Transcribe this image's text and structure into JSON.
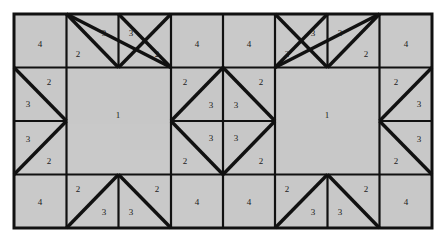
{
  "figure": {
    "name": "quilt-block-pattern",
    "background_color": "#ffffff",
    "patch_fill_color": "#c9c9c9",
    "line_color": "#111111",
    "grid": {
      "columns": 8,
      "rows": 4,
      "cell_width": 52.25,
      "cell_height": 53.5,
      "origin_x": 14,
      "origin_y": 14,
      "width": 418,
      "height": 214
    }
  },
  "chart_data": {
    "type": "diagram",
    "xlabel": "",
    "ylabel": "",
    "legend": [],
    "piece_codes": [
      "1",
      "2",
      "3",
      "4"
    ],
    "patches": [
      {
        "id": "r1c1",
        "label": "4",
        "shape": "square",
        "row": 1,
        "col": 1,
        "lx": 40,
        "ly": 45
      },
      {
        "id": "r1c2a",
        "label": "2",
        "shape": "tri-lower-left",
        "row": 1,
        "col": 2,
        "lx": 78,
        "ly": 55
      },
      {
        "id": "r1c2b",
        "label": "3",
        "shape": "tri-upper-right",
        "row": 1,
        "col": 2,
        "lx": 104,
        "ly": 34
      },
      {
        "id": "r1c3a",
        "label": "3",
        "shape": "tri-upper-left",
        "row": 1,
        "col": 3,
        "lx": 131,
        "ly": 34
      },
      {
        "id": "r1c3b",
        "label": "2",
        "shape": "tri-lower-right",
        "row": 1,
        "col": 3,
        "lx": 157,
        "ly": 55
      },
      {
        "id": "r1c4",
        "label": "4",
        "shape": "square",
        "row": 1,
        "col": 4,
        "lx": 197,
        "ly": 45
      },
      {
        "id": "r1c5",
        "label": "4",
        "shape": "square",
        "row": 1,
        "col": 5,
        "lx": 249,
        "ly": 45
      },
      {
        "id": "r1c6a",
        "label": "2",
        "shape": "tri-lower-left",
        "row": 1,
        "col": 6,
        "lx": 287,
        "ly": 55
      },
      {
        "id": "r1c6b",
        "label": "3",
        "shape": "tri-upper-right",
        "row": 1,
        "col": 6,
        "lx": 313,
        "ly": 34
      },
      {
        "id": "r1c7a",
        "label": "3",
        "shape": "tri-upper-left",
        "row": 1,
        "col": 7,
        "lx": 340,
        "ly": 34
      },
      {
        "id": "r1c7b",
        "label": "2",
        "shape": "tri-lower-right",
        "row": 1,
        "col": 7,
        "lx": 366,
        "ly": 55
      },
      {
        "id": "r1c8",
        "label": "4",
        "shape": "square",
        "row": 1,
        "col": 8,
        "lx": 406,
        "ly": 45
      },
      {
        "id": "r2c1a",
        "label": "2",
        "shape": "tri-upper-right",
        "row": 2,
        "col": 1,
        "lx": 49,
        "ly": 83
      },
      {
        "id": "r2c1b",
        "label": "3",
        "shape": "tri-lower-left",
        "row": 2,
        "col": 1,
        "lx": 28,
        "ly": 105
      },
      {
        "id": "big-left",
        "label": "1",
        "shape": "big-square",
        "row": 2,
        "col": 2,
        "lx": 118,
        "ly": 116
      },
      {
        "id": "r2c4a",
        "label": "2",
        "shape": "tri-upper-left",
        "row": 2,
        "col": 4,
        "lx": 185,
        "ly": 83
      },
      {
        "id": "r2c4b",
        "label": "3",
        "shape": "tri-lower-right",
        "row": 2,
        "col": 4,
        "lx": 211,
        "ly": 106
      },
      {
        "id": "r2c5a",
        "label": "3",
        "shape": "tri-lower-left",
        "row": 2,
        "col": 5,
        "lx": 236,
        "ly": 106
      },
      {
        "id": "r2c5b",
        "label": "2",
        "shape": "tri-upper-right",
        "row": 2,
        "col": 5,
        "lx": 261,
        "ly": 83
      },
      {
        "id": "big-right",
        "label": "1",
        "shape": "big-square",
        "row": 2,
        "col": 6,
        "lx": 327,
        "ly": 116
      },
      {
        "id": "r2c8a",
        "label": "2",
        "shape": "tri-upper-left",
        "row": 2,
        "col": 8,
        "lx": 396,
        "ly": 83
      },
      {
        "id": "r2c8b",
        "label": "3",
        "shape": "tri-lower-right",
        "row": 2,
        "col": 8,
        "lx": 419,
        "ly": 105
      },
      {
        "id": "r3c1a",
        "label": "3",
        "shape": "tri-upper-left",
        "row": 3,
        "col": 1,
        "lx": 28,
        "ly": 140
      },
      {
        "id": "r3c1b",
        "label": "2",
        "shape": "tri-lower-right",
        "row": 3,
        "col": 1,
        "lx": 49,
        "ly": 162
      },
      {
        "id": "r3c4a",
        "label": "3",
        "shape": "tri-upper-left",
        "row": 3,
        "col": 4,
        "lx": 211,
        "ly": 139
      },
      {
        "id": "r3c4b",
        "label": "2",
        "shape": "tri-lower-left",
        "row": 3,
        "col": 4,
        "lx": 185,
        "ly": 162
      },
      {
        "id": "r3c5a",
        "label": "3",
        "shape": "tri-upper-right",
        "row": 3,
        "col": 5,
        "lx": 236,
        "ly": 139
      },
      {
        "id": "r3c5b",
        "label": "2",
        "shape": "tri-lower-right",
        "row": 3,
        "col": 5,
        "lx": 261,
        "ly": 162
      },
      {
        "id": "r3c8a",
        "label": "3",
        "shape": "tri-upper-right",
        "row": 3,
        "col": 8,
        "lx": 419,
        "ly": 140
      },
      {
        "id": "r3c8b",
        "label": "2",
        "shape": "tri-lower-left",
        "row": 3,
        "col": 8,
        "lx": 396,
        "ly": 162
      },
      {
        "id": "r4c1",
        "label": "4",
        "shape": "square",
        "row": 4,
        "col": 1,
        "lx": 40,
        "ly": 203
      },
      {
        "id": "r4c2a",
        "label": "2",
        "shape": "tri-upper-left",
        "row": 4,
        "col": 2,
        "lx": 78,
        "ly": 190
      },
      {
        "id": "r4c2b",
        "label": "3",
        "shape": "tri-lower-right",
        "row": 4,
        "col": 2,
        "lx": 104,
        "ly": 213
      },
      {
        "id": "r4c3a",
        "label": "3",
        "shape": "tri-lower-left",
        "row": 4,
        "col": 3,
        "lx": 131,
        "ly": 213
      },
      {
        "id": "r4c3b",
        "label": "2",
        "shape": "tri-upper-right",
        "row": 4,
        "col": 3,
        "lx": 157,
        "ly": 190
      },
      {
        "id": "r4c4",
        "label": "4",
        "shape": "square",
        "row": 4,
        "col": 4,
        "lx": 197,
        "ly": 203
      },
      {
        "id": "r4c5",
        "label": "4",
        "shape": "square",
        "row": 4,
        "col": 5,
        "lx": 249,
        "ly": 203
      },
      {
        "id": "r4c6a",
        "label": "2",
        "shape": "tri-upper-left",
        "row": 4,
        "col": 6,
        "lx": 287,
        "ly": 190
      },
      {
        "id": "r4c6b",
        "label": "3",
        "shape": "tri-lower-right",
        "row": 4,
        "col": 6,
        "lx": 313,
        "ly": 213
      },
      {
        "id": "r4c7a",
        "label": "3",
        "shape": "tri-lower-left",
        "row": 4,
        "col": 7,
        "lx": 340,
        "ly": 213
      },
      {
        "id": "r4c7b",
        "label": "2",
        "shape": "tri-upper-right",
        "row": 4,
        "col": 7,
        "lx": 366,
        "ly": 190
      },
      {
        "id": "r4c8",
        "label": "4",
        "shape": "square",
        "row": 4,
        "col": 8,
        "lx": 406,
        "ly": 203
      }
    ]
  }
}
